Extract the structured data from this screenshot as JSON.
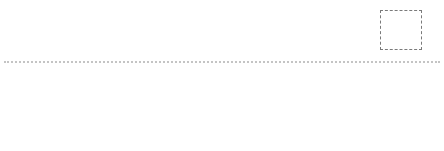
{
  "colors": {
    "circle_dark": "#8a8a8a",
    "circle_dark_border": "#6f6f6f",
    "circle_light": "#c6c6c6",
    "circle_light_border": "#8e8e8e",
    "square_light": "#c4c4c4",
    "square_light_border": "#7c7c7c",
    "square_dark": "#8c8c8c",
    "square_dark_border": "#5f5f5f"
  },
  "question": {
    "mark": "?",
    "sequence": [
      {
        "id": "fig-1",
        "left": 20,
        "top": 12,
        "elements": [
          "square-light",
          "circle-dark",
          "circle-dark",
          "circle-dark",
          "circle-dark"
        ]
      },
      {
        "id": "fig-2",
        "left": 108,
        "top": 12,
        "elements": [
          "circle-dark",
          "square-light",
          "circle-dark",
          "circle-dark",
          "circle-dark"
        ]
      },
      {
        "id": "fig-3",
        "left": 199,
        "top": 12,
        "elements": [
          "circle-dark",
          "circle-dark",
          "square-light",
          "circle-dark",
          "circle-dark"
        ]
      },
      {
        "id": "fig-4",
        "left": 289,
        "top": 12,
        "elements": [
          "circle-dark",
          "circle-dark",
          "circle-dark",
          "square-light",
          "circle-dark"
        ]
      }
    ]
  },
  "options": [
    {
      "label": "A",
      "left": 33,
      "top": 68,
      "label_left": 38,
      "elements": [
        "circle-light",
        "circle-light",
        "circle-light",
        "circle-light",
        "square-dark"
      ]
    },
    {
      "label": "B",
      "left": 128,
      "top": 68,
      "label_left": 131,
      "elements": [
        "circle-dark",
        "circle-dark",
        "circle-dark",
        "circle-dark",
        "square-dark"
      ]
    },
    {
      "label": "C",
      "left": 229,
      "top": 68,
      "label_left": 229,
      "elements": [
        "circle-dark",
        "circle-dark",
        "circle-dark",
        "circle-dark",
        "square-light"
      ]
    },
    {
      "label": "D",
      "left": 323,
      "top": 68,
      "label_left": 328,
      "elements": [
        "circle-dark",
        "circle-dark",
        "square-light",
        "circle-dark",
        "circle-dark"
      ]
    }
  ]
}
